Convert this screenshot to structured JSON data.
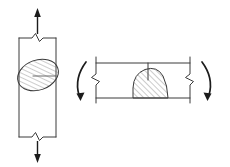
{
  "figure": {
    "background_color": "#ffffff",
    "line_color": "#3a3a3a",
    "arrow_color": "#1c1c1c",
    "hatch_color": "#6b6b6b",
    "panels": [
      {
        "id": "axial-panel",
        "name": "axial-tension-panel",
        "member_orientation": "vertical",
        "load_type": "axial tension",
        "arrows": [
          {
            "name": "top-tension-arrow",
            "direction": "up",
            "style": "straight"
          },
          {
            "name": "bottom-tension-arrow",
            "direction": "down",
            "style": "straight"
          }
        ],
        "break_lines": 2,
        "flaw": {
          "name": "elliptical-flaw",
          "shape": "ellipse",
          "hatched": true,
          "hatch_direction": "forward-slash",
          "rotation_deg": -20
        }
      },
      {
        "id": "bending-panel",
        "name": "bending-load-panel",
        "member_orientation": "horizontal",
        "load_type": "bending",
        "arrows": [
          {
            "name": "left-moment-arrow",
            "direction": "counterclockwise",
            "style": "curved"
          },
          {
            "name": "right-moment-arrow",
            "direction": "clockwise",
            "style": "curved"
          }
        ],
        "break_lines": 2,
        "flaw": {
          "name": "dome-flaw",
          "shape": "dome",
          "hatched": true,
          "hatch_direction": "forward-slash",
          "seated_on": "bottom-edge"
        },
        "center_tick": true
      }
    ]
  }
}
